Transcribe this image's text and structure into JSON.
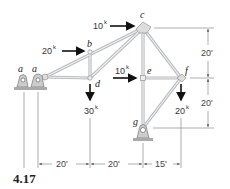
{
  "figure": {
    "number": "4.17",
    "nodes": {
      "a1": {
        "label": "a"
      },
      "a2": {
        "label": "a"
      },
      "b": {
        "label": "b"
      },
      "c": {
        "label": "c"
      },
      "d": {
        "label": "d"
      },
      "e": {
        "label": "e"
      },
      "f": {
        "label": "f"
      },
      "g": {
        "label": "g"
      }
    },
    "loads": {
      "b": {
        "value": "20",
        "unit": "k",
        "direction": "right"
      },
      "c": {
        "value": "10",
        "unit": "k",
        "direction": "right"
      },
      "e": {
        "value": "10",
        "unit": "k",
        "direction": "right"
      },
      "d": {
        "value": "30",
        "unit": "k",
        "direction": "down"
      },
      "f": {
        "value": "20",
        "unit": "k",
        "direction": "down"
      }
    },
    "dimensions": {
      "horizontal": [
        "20'",
        "20'",
        "15'"
      ],
      "vertical": [
        "20'",
        "20'"
      ]
    }
  }
}
